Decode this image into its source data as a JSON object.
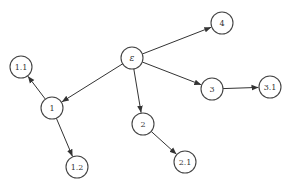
{
  "diagram": {
    "type": "tree",
    "node_radius": 11,
    "colors": {
      "stroke": "#444444",
      "edge": "#333333",
      "fill": "#ffffff",
      "text": "#333333"
    },
    "nodes": [
      {
        "id": "root",
        "label": "ε",
        "x": 132,
        "y": 58
      },
      {
        "id": "n1",
        "label": "1",
        "x": 52,
        "y": 108
      },
      {
        "id": "n1_1",
        "label": "1.1",
        "x": 21,
        "y": 67
      },
      {
        "id": "n1_2",
        "label": "1.2",
        "x": 77,
        "y": 167
      },
      {
        "id": "n2",
        "label": "2",
        "x": 143,
        "y": 124
      },
      {
        "id": "n2_1",
        "label": "2.1",
        "x": 185,
        "y": 162
      },
      {
        "id": "n3",
        "label": "3",
        "x": 212,
        "y": 89
      },
      {
        "id": "n3_1",
        "label": "3.1",
        "x": 270,
        "y": 87
      },
      {
        "id": "n4",
        "label": "4",
        "x": 222,
        "y": 23
      }
    ],
    "edges": [
      {
        "from": "root",
        "to": "n4"
      },
      {
        "from": "root",
        "to": "n3"
      },
      {
        "from": "root",
        "to": "n2"
      },
      {
        "from": "root",
        "to": "n1"
      },
      {
        "from": "n1",
        "to": "n1_1"
      },
      {
        "from": "n1",
        "to": "n1_2"
      },
      {
        "from": "n2",
        "to": "n2_1"
      },
      {
        "from": "n3",
        "to": "n3_1"
      }
    ]
  }
}
